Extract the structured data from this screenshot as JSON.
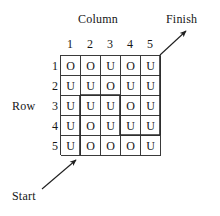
{
  "figure": {
    "labels": {
      "column": "Column",
      "row": "Row",
      "start": "Start",
      "finish": "Finish"
    },
    "column_headers": [
      "1",
      "2",
      "3",
      "4",
      "5"
    ],
    "row_headers": [
      "1",
      "2",
      "3",
      "4",
      "5"
    ],
    "grid": [
      [
        "O",
        "O",
        "U",
        "O",
        "U"
      ],
      [
        "U",
        "U",
        "O",
        "U",
        "U"
      ],
      [
        "U",
        "U",
        "U",
        "O",
        "U"
      ],
      [
        "U",
        "O",
        "U",
        "U",
        "U"
      ],
      [
        "U",
        "O",
        "O",
        "O",
        "U"
      ]
    ],
    "colors": {
      "grid_line": "#3a3a3a",
      "path_line": "#2b2b2b",
      "text": "#141414",
      "background": "#ffffff"
    },
    "icons": {
      "start_arrow": "arrow-up-right-icon",
      "finish_arrow": "arrow-up-right-icon"
    }
  }
}
